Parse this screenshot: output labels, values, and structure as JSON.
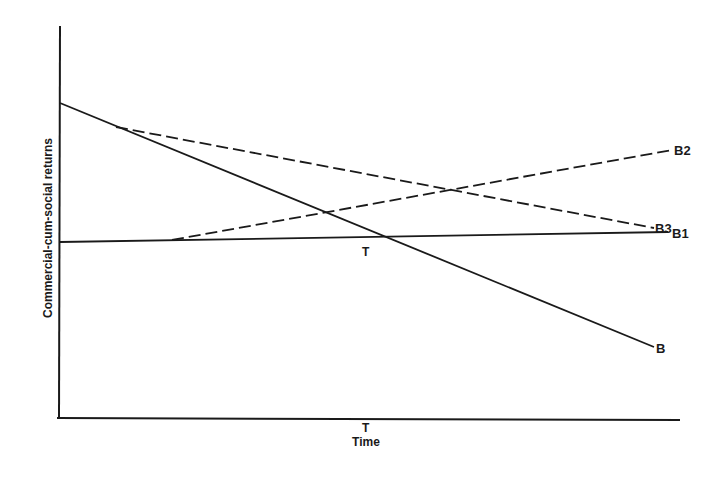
{
  "diagram": {
    "y_axis_label": "Commercial-cum-social returns",
    "x_axis_label": "Time",
    "x_axis_marker": "T",
    "intersection_marker": "T",
    "lines": [
      {
        "id": "B",
        "label": "B",
        "style": "solid",
        "description": "declining line"
      },
      {
        "id": "B1",
        "label": "B1",
        "style": "solid",
        "description": "roughly flat line"
      },
      {
        "id": "B2",
        "label": "B2",
        "style": "dashed",
        "description": "rising dashed line branching from B1"
      },
      {
        "id": "B3",
        "label": "B3",
        "style": "dashed",
        "description": "gently declining dashed line branching from B"
      }
    ],
    "colors": {
      "ink": "#1a1a1a",
      "background": "#ffffff"
    }
  }
}
